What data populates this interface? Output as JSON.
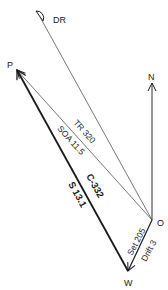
{
  "diagram": {
    "type": "current-sailing vector triangle",
    "points": {
      "DR": {
        "label": "DR"
      },
      "P": {
        "label": "P"
      },
      "N": {
        "label": "N"
      },
      "O": {
        "label": "O"
      },
      "W": {
        "label": "W"
      }
    },
    "vectors": {
      "track": {
        "label_top": "TR 320",
        "label_bottom": "SOA 11.5"
      },
      "course": {
        "label_top": "C-332",
        "label_bottom": "S 13.1"
      },
      "current": {
        "label_top": "Set 205",
        "label_bottom": "Drift 3"
      }
    },
    "colors": {
      "line": "#1a1a1a",
      "thin_line": "#555555",
      "background": "#ffffff"
    }
  }
}
